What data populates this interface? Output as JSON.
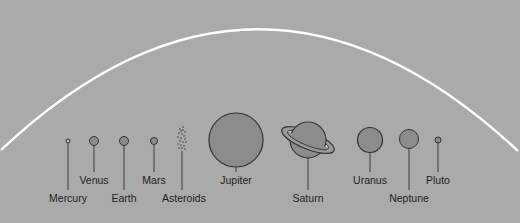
{
  "diagram": {
    "title": "",
    "background_color": "#aaaaaa",
    "orbit_arc_color": "#ffffff",
    "planet_fill_color": "#8c8c8c",
    "outline_color": "#333333",
    "bodies": [
      {
        "name": "Mercury",
        "cx": 68,
        "cy": 141,
        "r": 2,
        "label_y": 192
      },
      {
        "name": "Venus",
        "cx": 94,
        "cy": 141,
        "r": 4.5,
        "label_y": 174
      },
      {
        "name": "Earth",
        "cx": 124,
        "cy": 141,
        "r": 4.5,
        "label_y": 192
      },
      {
        "name": "Mars",
        "cx": 154,
        "cy": 141,
        "r": 3.5,
        "label_y": 174
      },
      {
        "name": "Asteroids",
        "cx": 182,
        "cy": 139,
        "r": 0,
        "label_y": 192
      },
      {
        "name": "Jupiter",
        "cx": 236,
        "cy": 140,
        "r": 27,
        "label_y": 174
      },
      {
        "name": "Saturn",
        "cx": 308,
        "cy": 140,
        "r": 18,
        "label_y": 192
      },
      {
        "name": "Uranus",
        "cx": 370,
        "cy": 140,
        "r": 12.5,
        "label_y": 174
      },
      {
        "name": "Neptune",
        "cx": 409,
        "cy": 139,
        "r": 9.5,
        "label_y": 192
      },
      {
        "name": "Pluto",
        "cx": 438,
        "cy": 140,
        "r": 3,
        "label_y": 174
      }
    ]
  }
}
